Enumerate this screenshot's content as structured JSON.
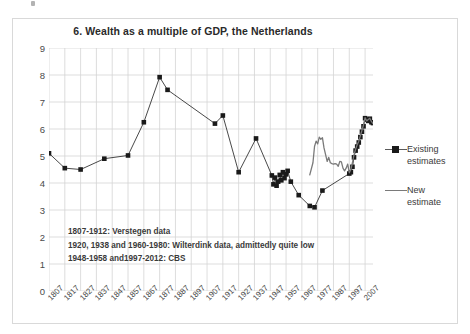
{
  "chart_data": {
    "type": "line",
    "title": "6. Wealth as a multiple of GDP, the Netherlands",
    "xlabel": "",
    "ylabel": "",
    "ylim": [
      0,
      9
    ],
    "xlim": [
      1807,
      2012
    ],
    "ytick_step": 1,
    "yticks": [
      "0",
      "1",
      "2",
      "3",
      "4",
      "5",
      "6",
      "7",
      "8",
      "9"
    ],
    "xticks": [
      "1807",
      "1817",
      "1827",
      "1837",
      "1847",
      "1857",
      "1867",
      "1877",
      "1887",
      "1897",
      "1907",
      "1917",
      "1927",
      "1937",
      "1947",
      "1957",
      "1967",
      "1977",
      "1987",
      "1997",
      "2007"
    ],
    "grid": true,
    "legend_position": "right",
    "series": [
      {
        "name": "Existing estimates",
        "style": "line-with-square-markers",
        "color": "#1a1a1a",
        "points": [
          [
            1807,
            5.1
          ],
          [
            1817,
            4.55
          ],
          [
            1827,
            4.5
          ],
          [
            1842,
            4.9
          ],
          [
            1857,
            5.02
          ],
          [
            1867,
            6.25
          ],
          [
            1877,
            7.92
          ],
          [
            1882,
            7.45
          ],
          [
            1912,
            6.2
          ],
          [
            1917,
            6.5
          ],
          [
            1927,
            4.4
          ],
          [
            1938,
            5.65
          ],
          [
            1948,
            4.28
          ],
          [
            1949,
            3.95
          ],
          [
            1950,
            4.2
          ],
          [
            1951,
            3.9
          ],
          [
            1952,
            4.05
          ],
          [
            1953,
            4.3
          ],
          [
            1954,
            4.1
          ],
          [
            1955,
            4.4
          ],
          [
            1956,
            4.18
          ],
          [
            1957,
            4.32
          ],
          [
            1958,
            4.45
          ],
          [
            1960,
            4.05
          ],
          [
            1965,
            3.55
          ],
          [
            1972,
            3.15
          ],
          [
            1975,
            3.1
          ],
          [
            1980,
            3.72
          ],
          [
            1997,
            4.35
          ],
          [
            1998,
            4.4
          ],
          [
            1999,
            4.6
          ],
          [
            2000,
            4.95
          ],
          [
            2001,
            5.2
          ],
          [
            2002,
            5.35
          ],
          [
            2003,
            5.5
          ],
          [
            2004,
            5.7
          ],
          [
            2005,
            5.9
          ],
          [
            2006,
            6.1
          ],
          [
            2007,
            6.4
          ],
          [
            2008,
            6.35
          ],
          [
            2009,
            6.3
          ],
          [
            2010,
            6.38
          ],
          [
            2011,
            6.25
          ],
          [
            2012,
            6.22
          ]
        ]
      },
      {
        "name": "New estimate",
        "style": "line",
        "color": "#7a7a7a",
        "points": [
          [
            1972,
            4.3
          ],
          [
            1974,
            4.75
          ],
          [
            1975,
            5.35
          ],
          [
            1976,
            5.55
          ],
          [
            1977,
            5.45
          ],
          [
            1978,
            5.7
          ],
          [
            1979,
            5.62
          ],
          [
            1980,
            5.68
          ],
          [
            1981,
            5.3
          ],
          [
            1982,
            5.05
          ],
          [
            1983,
            4.8
          ],
          [
            1984,
            4.95
          ],
          [
            1985,
            4.75
          ],
          [
            1986,
            4.72
          ],
          [
            1987,
            4.7
          ],
          [
            1988,
            4.72
          ],
          [
            1989,
            4.7
          ],
          [
            1990,
            4.62
          ],
          [
            1991,
            4.8
          ],
          [
            1992,
            4.78
          ],
          [
            1993,
            4.55
          ],
          [
            1994,
            4.45
          ],
          [
            1995,
            4.55
          ],
          [
            1996,
            4.7
          ],
          [
            1997,
            4.38
          ],
          [
            1998,
            4.5
          ],
          [
            1999,
            4.75
          ],
          [
            2000,
            5.05
          ],
          [
            2001,
            5.25
          ],
          [
            2002,
            5.42
          ],
          [
            2003,
            5.55
          ],
          [
            2004,
            5.75
          ],
          [
            2005,
            5.95
          ],
          [
            2006,
            6.15
          ],
          [
            2007,
            6.42
          ],
          [
            2008,
            6.3
          ],
          [
            2009,
            6.35
          ],
          [
            2010,
            6.4
          ],
          [
            2011,
            6.28
          ],
          [
            2012,
            6.2
          ]
        ]
      }
    ],
    "annotations": [
      "1807-1912: Verstegen data",
      "1920, 1938 and 1960-1980: Wilterdink data, admittedly quite low",
      "1948-1958 and1997-2012: CBS"
    ]
  },
  "legend": {
    "items": [
      {
        "label_line1": "Existing",
        "label_line2": "estimates"
      },
      {
        "label_line1": "New estimate",
        "label_line2": ""
      }
    ]
  },
  "colors": {
    "existing": "#1a1a1a",
    "new": "#7a7a7a",
    "grid": "#d4d4d4",
    "frame": "#d9d9d9",
    "text": "#3a3a3a"
  }
}
